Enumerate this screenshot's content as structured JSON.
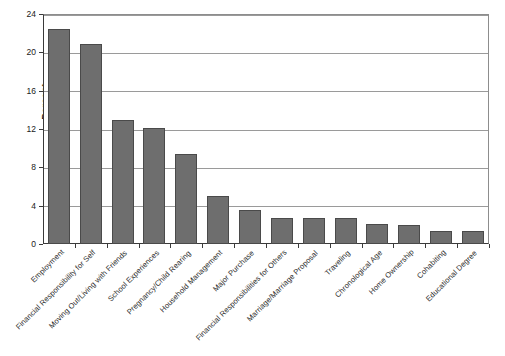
{
  "chart_data": {
    "type": "bar",
    "title": "",
    "xlabel": "",
    "ylabel": "Percent",
    "ylim": [
      0,
      24
    ],
    "yticks": [
      0,
      4,
      8,
      12,
      16,
      20,
      24
    ],
    "grid": true,
    "legend": "none",
    "bar_color": "#6e6e6e",
    "bar_edge_color": "#4a4a4a",
    "categories": [
      "Employment",
      "Financial Responsibility for Self",
      "Moving Out/Living with Friends",
      "School Experiences",
      "Pregnancy/Child Rearing",
      "Household Management",
      "Major Purchase",
      "Financial Responsibilities for Others",
      "Marriage/Marriage Proposal",
      "Traveling",
      "Chronological Age",
      "Home Ownership",
      "Cohabiting",
      "Educational Degree"
    ],
    "values": [
      22.4,
      20.9,
      12.9,
      12.1,
      9.4,
      5.0,
      3.5,
      2.7,
      2.7,
      2.7,
      2.1,
      2.0,
      1.4,
      1.4
    ]
  }
}
